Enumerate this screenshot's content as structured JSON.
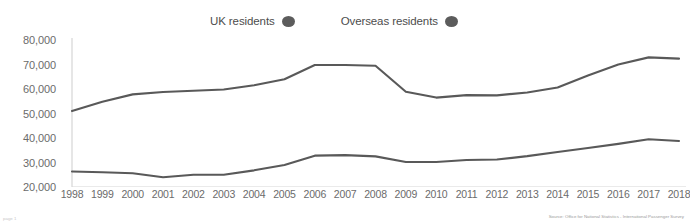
{
  "legend": {
    "position": "top-center",
    "entries": [
      {
        "label": "UK residents",
        "marker": "filled-circle",
        "color": "#5c5c5c"
      },
      {
        "label": "Overseas residents",
        "marker": "filled-circle",
        "color": "#5c5c5c"
      }
    ]
  },
  "footer": {
    "source": "Source: Office for National Statistics - International Passenger Survey",
    "page_mark": "page 1"
  },
  "style": {
    "line_color": "#595959",
    "axis_color": "#d6d6d6",
    "tick_label_color": "#6b6b6b",
    "background": "#ffffff"
  },
  "chart_data": {
    "type": "line",
    "title": "",
    "subtitle": "",
    "xlabel": "",
    "ylabel": "",
    "grid": false,
    "legend_position": "top-center",
    "ylim": [
      20000,
      80000
    ],
    "ytick_step": 10000,
    "ytick_labels": [
      "80,000",
      "70,000",
      "60,000",
      "50,000",
      "40,000",
      "30,000",
      "20,000"
    ],
    "ytick_values": [
      80000,
      70000,
      60000,
      50000,
      40000,
      30000,
      20000
    ],
    "categories": [
      "1998",
      "1999",
      "2000",
      "2001",
      "2002",
      "2003",
      "2004",
      "2005",
      "2006",
      "2007",
      "2008",
      "2009",
      "2010",
      "2011",
      "2012",
      "2013",
      "2014",
      "2015",
      "2016",
      "2017",
      "2018"
    ],
    "x": [
      1998,
      1999,
      2000,
      2001,
      2002,
      2003,
      2004,
      2005,
      2006,
      2007,
      2008,
      2009,
      2010,
      2011,
      2012,
      2013,
      2014,
      2015,
      2016,
      2017,
      2018
    ],
    "series": [
      {
        "name": "UK residents",
        "color": "#595959",
        "values": [
          51000,
          54800,
          57800,
          58800,
          59300,
          59800,
          61500,
          64000,
          69800,
          69800,
          69500,
          58900,
          56500,
          57500,
          57400,
          58600,
          60600,
          65500,
          70000,
          72900,
          72400
        ]
      },
      {
        "name": "Overseas residents",
        "color": "#595959",
        "values": [
          26300,
          26000,
          25600,
          24000,
          25000,
          25000,
          26800,
          29000,
          32800,
          33000,
          32500,
          30200,
          30200,
          31000,
          31200,
          32600,
          34300,
          35900,
          37600,
          39500,
          38800
        ]
      }
    ]
  }
}
